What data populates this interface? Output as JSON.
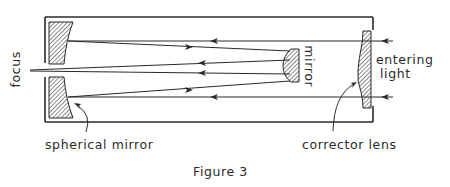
{
  "figure": {
    "caption": "Figure 3",
    "type": "Schmidt-Cassegrain telescope optical path diagram"
  },
  "labels": {
    "focus": "focus",
    "secondary_mirror": "mirror",
    "entering_light_line1": "entering",
    "entering_light_line2": "light",
    "spherical_mirror": "spherical mirror",
    "corrector_lens": "corrector lens"
  },
  "colors": {
    "line": "#2a2a2a",
    "background": "#ffffff"
  }
}
